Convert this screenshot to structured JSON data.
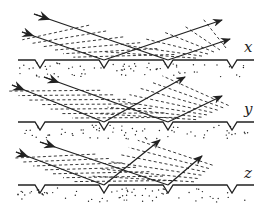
{
  "diagram": {
    "panels": [
      {
        "label": "x",
        "surface_y": 60,
        "label_pos": [
          244,
          50
        ],
        "incoming": [
          {
            "from": [
              34,
              14
            ],
            "to": [
              168,
              60
            ]
          },
          {
            "from": [
              22,
              32
            ],
            "to": [
              104,
              60
            ]
          }
        ],
        "outgoing": [
          {
            "from": [
              104,
              60
            ],
            "to": [
              222,
              20
            ]
          },
          {
            "from": [
              168,
              60
            ],
            "to": [
              230,
              39
            ]
          }
        ],
        "wavefronts_in": {
          "count": 6,
          "angle_deg": 70,
          "dashed": true
        },
        "wavefronts_out": {
          "count": 6,
          "angle_deg": 110,
          "dashed": true
        }
      },
      {
        "label": "y",
        "surface_y": 122,
        "label_pos": [
          244,
          113
        ],
        "incoming": [
          {
            "from": [
              44,
              77
            ],
            "to": [
              168,
              122
            ]
          },
          {
            "from": [
              12,
              85
            ],
            "to": [
              104,
              122
            ]
          }
        ],
        "outgoing": [
          {
            "from": [
              104,
              122
            ],
            "to": [
              185,
              77
            ]
          },
          {
            "from": [
              168,
              122
            ],
            "to": [
              222,
              96
            ]
          }
        ],
        "wavefronts_in": {
          "count": 7,
          "angle_deg": 70,
          "dashed": true
        },
        "wavefronts_out": {
          "count": 7,
          "angle_deg": 120,
          "dashed": true
        }
      },
      {
        "label": "z",
        "surface_y": 185,
        "label_pos": [
          244,
          176
        ],
        "incoming": [
          {
            "from": [
              40,
              142
            ],
            "to": [
              168,
              185
            ]
          },
          {
            "from": [
              16,
              152
            ],
            "to": [
              104,
              185
            ]
          }
        ],
        "outgoing": [
          {
            "from": [
              104,
              185
            ],
            "to": [
              160,
              140
            ]
          },
          {
            "from": [
              168,
              185
            ],
            "to": [
              202,
              156
            ]
          }
        ],
        "wavefronts_in": {
          "count": 7,
          "angle_deg": 70,
          "dashed": true
        },
        "wavefronts_out": {
          "count": 6,
          "angle_deg": 130,
          "dashed": true
        }
      }
    ],
    "notch_x": [
      40,
      104,
      168,
      232
    ],
    "colors": {
      "ink": "#222222",
      "background": "#ffffff"
    }
  }
}
